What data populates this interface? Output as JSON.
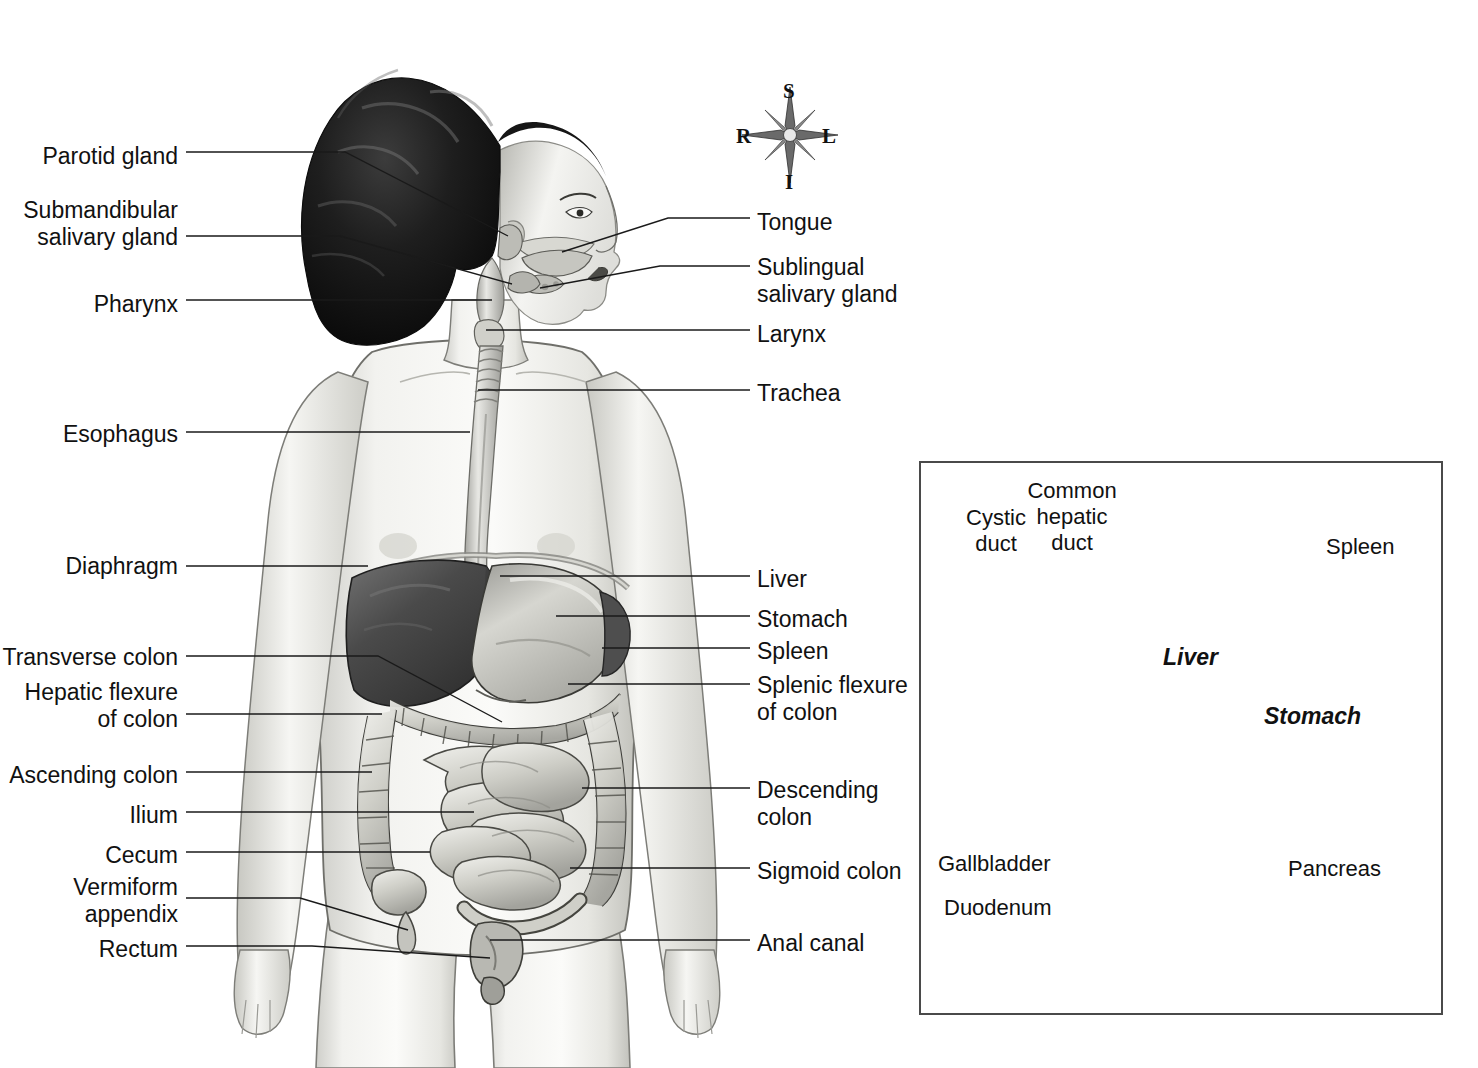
{
  "figure": {
    "orientation_compass": {
      "name": "anatomical-orientation-rose",
      "superior": "S",
      "inferior": "I",
      "right": "R",
      "left": "L"
    }
  },
  "main_figure": {
    "left_labels": [
      {
        "id": "parotid-gland",
        "text": "Parotid gland",
        "x": 178,
        "y": 143,
        "align": "right"
      },
      {
        "id": "submandibular-salivary-gland",
        "text": "Submandibular\nsalivary gland",
        "x": 178,
        "y": 197,
        "align": "right"
      },
      {
        "id": "pharynx",
        "text": "Pharynx",
        "x": 178,
        "y": 291,
        "align": "right"
      },
      {
        "id": "esophagus",
        "text": "Esophagus",
        "x": 178,
        "y": 421,
        "align": "right"
      },
      {
        "id": "diaphragm",
        "text": "Diaphragm",
        "x": 178,
        "y": 553,
        "align": "right"
      },
      {
        "id": "transverse-colon",
        "text": "Transverse colon",
        "x": 178,
        "y": 644,
        "align": "right"
      },
      {
        "id": "hepatic-flexure-of-colon",
        "text": "Hepatic flexure\nof colon",
        "x": 178,
        "y": 680,
        "align": "right"
      },
      {
        "id": "ascending-colon",
        "text": "Ascending colon",
        "x": 178,
        "y": 762,
        "align": "right"
      },
      {
        "id": "ilium",
        "text": "Ilium",
        "x": 178,
        "y": 803,
        "align": "right"
      },
      {
        "id": "cecum",
        "text": "Cecum",
        "x": 178,
        "y": 842,
        "align": "right"
      },
      {
        "id": "vermiform-appendix",
        "text": "Vermiform\nappendix",
        "x": 178,
        "y": 875,
        "align": "right"
      },
      {
        "id": "rectum",
        "text": "Rectum",
        "x": 178,
        "y": 936,
        "align": "right"
      }
    ],
    "right_labels": [
      {
        "id": "tongue",
        "text": "Tongue",
        "x": 757,
        "y": 209,
        "align": "left"
      },
      {
        "id": "sublingual-salivary-gland",
        "text": "Sublingual\nsalivary gland",
        "x": 757,
        "y": 254,
        "align": "left"
      },
      {
        "id": "larynx",
        "text": "Larynx",
        "x": 757,
        "y": 321,
        "align": "left"
      },
      {
        "id": "trachea",
        "text": "Trachea",
        "x": 757,
        "y": 380,
        "align": "left"
      },
      {
        "id": "liver",
        "text": "Liver",
        "x": 757,
        "y": 567,
        "align": "left"
      },
      {
        "id": "stomach",
        "text": "Stomach",
        "x": 757,
        "y": 607,
        "align": "left"
      },
      {
        "id": "spleen",
        "text": "Spleen",
        "x": 757,
        "y": 639,
        "align": "left"
      },
      {
        "id": "splenic-flexure-of-colon",
        "text": "Splenic flexure\nof colon",
        "x": 757,
        "y": 673,
        "align": "left"
      },
      {
        "id": "descending-colon",
        "text": "Descending\ncolon",
        "x": 757,
        "y": 778,
        "align": "left"
      },
      {
        "id": "sigmoid-colon",
        "text": "Sigmoid colon",
        "x": 757,
        "y": 859,
        "align": "left"
      },
      {
        "id": "anal-canal",
        "text": "Anal canal",
        "x": 757,
        "y": 931,
        "align": "left"
      }
    ]
  },
  "inset_figure": {
    "name": "liver-stomach-detail-inset",
    "border_color": "#4a4a4a",
    "labels": [
      {
        "id": "cystic-duct",
        "text": "Cystic\nduct",
        "x": 966,
        "y": 507,
        "align": "center"
      },
      {
        "id": "common-hepatic-duct",
        "text": "Common\nhepatic\nduct",
        "x": 1069,
        "y": 480,
        "align": "center"
      },
      {
        "id": "spleen-inset",
        "text": "Spleen",
        "x": 1328,
        "y": 535,
        "align": "left"
      },
      {
        "id": "gallbladder",
        "text": "Gallbladder",
        "x": 939,
        "y": 854,
        "align": "left"
      },
      {
        "id": "duodenum",
        "text": "Duodenum",
        "x": 944,
        "y": 898,
        "align": "left"
      },
      {
        "id": "pancreas",
        "text": "Pancreas",
        "x": 1288,
        "y": 859,
        "align": "left"
      }
    ],
    "organ_labels": [
      {
        "id": "liver-inset",
        "text": "Liver",
        "x": 1163,
        "y": 644
      },
      {
        "id": "stomach-inset",
        "text": "Stomach",
        "x": 1264,
        "y": 704
      }
    ]
  },
  "colors": {
    "line": "#1a1a1a",
    "border": "#4a4a4a",
    "liver_dark": "#4c4c4c",
    "stomach_light": "#d7d7d2",
    "skin": "#efefed",
    "hair": "#1b1b1b",
    "background": "#ffffff"
  }
}
